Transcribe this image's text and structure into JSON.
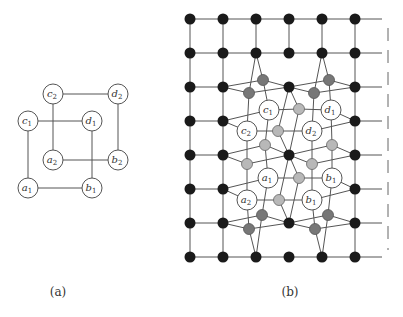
{
  "figure": {
    "panel_a": {
      "caption": "(a)",
      "nodes": [
        {
          "id": "c2",
          "letter": "c",
          "sub": "2",
          "x": 53,
          "y": 94
        },
        {
          "id": "d2",
          "letter": "d",
          "sub": "2",
          "x": 118,
          "y": 94
        },
        {
          "id": "c1",
          "letter": "c",
          "sub": "1",
          "x": 28,
          "y": 121
        },
        {
          "id": "d1",
          "letter": "d",
          "sub": "1",
          "x": 92,
          "y": 121
        },
        {
          "id": "a2",
          "letter": "a",
          "sub": "2",
          "x": 53,
          "y": 160
        },
        {
          "id": "b2",
          "letter": "b",
          "sub": "2",
          "x": 118,
          "y": 160
        },
        {
          "id": "a1",
          "letter": "a",
          "sub": "1",
          "x": 28,
          "y": 188
        },
        {
          "id": "b1",
          "letter": "b",
          "sub": "1",
          "x": 92,
          "y": 188
        }
      ],
      "edges": [
        [
          "c2",
          "d2"
        ],
        [
          "c2",
          "a2"
        ],
        [
          "d2",
          "b2"
        ],
        [
          "a2",
          "b2"
        ],
        [
          "c1",
          "d1"
        ],
        [
          "c1",
          "a1"
        ],
        [
          "d1",
          "b1"
        ],
        [
          "a1",
          "b1"
        ]
      ],
      "radius": 10
    },
    "panel_b": {
      "caption": "(b)",
      "grid": {
        "cols": [
          190,
          223,
          256,
          289,
          322,
          355
        ],
        "rows": [
          19,
          53,
          87,
          121,
          155,
          189,
          223,
          257
        ],
        "line_end_x": 382,
        "dash_x": 388,
        "black_color": "#1a1a1a"
      },
      "hidden_grid": [
        [
          2,
          3
        ],
        [
          3,
          3
        ],
        [
          2,
          4
        ],
        [
          3,
          4
        ],
        [
          2,
          5
        ],
        [
          3,
          5
        ],
        [
          4,
          3
        ],
        [
          4,
          4
        ],
        [
          4,
          5
        ],
        [
          1,
          3
        ],
        [
          1,
          4
        ],
        [
          1,
          5
        ]
      ],
      "dark_gray": {
        "color": "#777777",
        "nodes": [
          [
            263,
            80
          ],
          [
            249,
            93
          ],
          [
            329,
            80
          ],
          [
            314,
            93
          ],
          [
            262,
            215
          ],
          [
            249,
            229
          ],
          [
            328,
            215
          ],
          [
            315,
            229
          ]
        ]
      },
      "light_gray": {
        "color": "#b8b8b8",
        "nodes": [
          [
            299,
            109
          ],
          [
            278,
            131
          ],
          [
            265,
            145
          ],
          [
            332,
            145
          ],
          [
            247,
            164
          ],
          [
            312,
            164
          ],
          [
            299,
            178
          ],
          [
            279,
            200
          ]
        ]
      },
      "labeled": [
        {
          "letter": "c",
          "sub": "1",
          "x": 269,
          "y": 110
        },
        {
          "letter": "d",
          "sub": "1",
          "x": 331,
          "y": 110
        },
        {
          "letter": "c",
          "sub": "2",
          "x": 247,
          "y": 131
        },
        {
          "letter": "d",
          "sub": "2",
          "x": 312,
          "y": 131
        },
        {
          "letter": "a",
          "sub": "1",
          "x": 268,
          "y": 178
        },
        {
          "letter": "b",
          "sub": "1",
          "x": 332,
          "y": 178
        },
        {
          "letter": "a",
          "sub": "2",
          "x": 247,
          "y": 200
        },
        {
          "letter": "b",
          "sub": "1",
          "x": 312,
          "y": 200
        }
      ],
      "extra_edges": [
        [
          256,
          53,
          263,
          80
        ],
        [
          256,
          53,
          249,
          93
        ],
        [
          322,
          53,
          329,
          80
        ],
        [
          322,
          53,
          314,
          93
        ],
        [
          223,
          87,
          263,
          80
        ],
        [
          223,
          87,
          249,
          93
        ],
        [
          263,
          80,
          289,
          87
        ],
        [
          249,
          93,
          289,
          87
        ],
        [
          289,
          87,
          329,
          80
        ],
        [
          289,
          87,
          314,
          93
        ],
        [
          329,
          80,
          355,
          87
        ],
        [
          314,
          93,
          355,
          87
        ],
        [
          249,
          93,
          247,
          131
        ],
        [
          263,
          80,
          269,
          110
        ],
        [
          329,
          80,
          331,
          110
        ],
        [
          314,
          93,
          312,
          131
        ],
        [
          289,
          87,
          299,
          109
        ],
        [
          289,
          87,
          278,
          131
        ],
        [
          299,
          109,
          289,
          155
        ],
        [
          278,
          131,
          289,
          155
        ],
        [
          269,
          110,
          299,
          109
        ],
        [
          299,
          109,
          331,
          110
        ],
        [
          247,
          131,
          278,
          131
        ],
        [
          278,
          131,
          312,
          131
        ],
        [
          223,
          121,
          269,
          110
        ],
        [
          223,
          121,
          247,
          131
        ],
        [
          331,
          110,
          355,
          121
        ],
        [
          312,
          131,
          355,
          121
        ],
        [
          269,
          110,
          265,
          145
        ],
        [
          247,
          131,
          247,
          164
        ],
        [
          331,
          110,
          332,
          145
        ],
        [
          312,
          131,
          312,
          164
        ],
        [
          223,
          155,
          265,
          145
        ],
        [
          223,
          155,
          247,
          164
        ],
        [
          265,
          145,
          289,
          155
        ],
        [
          247,
          164,
          289,
          155
        ],
        [
          289,
          155,
          332,
          145
        ],
        [
          289,
          155,
          312,
          164
        ],
        [
          332,
          145,
          355,
          155
        ],
        [
          312,
          164,
          355,
          155
        ],
        [
          265,
          145,
          268,
          178
        ],
        [
          247,
          164,
          247,
          200
        ],
        [
          332,
          145,
          332,
          178
        ],
        [
          312,
          164,
          312,
          200
        ],
        [
          268,
          178,
          299,
          178
        ],
        [
          299,
          178,
          332,
          178
        ],
        [
          247,
          200,
          279,
          200
        ],
        [
          279,
          200,
          312,
          200
        ],
        [
          223,
          189,
          268,
          178
        ],
        [
          223,
          189,
          247,
          200
        ],
        [
          332,
          178,
          355,
          189
        ],
        [
          312,
          200,
          355,
          189
        ],
        [
          289,
          155,
          299,
          178
        ],
        [
          289,
          155,
          279,
          200
        ],
        [
          299,
          178,
          289,
          223
        ],
        [
          279,
          200,
          289,
          223
        ],
        [
          268,
          178,
          262,
          215
        ],
        [
          247,
          200,
          249,
          229
        ],
        [
          332,
          178,
          328,
          215
        ],
        [
          312,
          200,
          315,
          229
        ],
        [
          223,
          223,
          262,
          215
        ],
        [
          223,
          223,
          249,
          229
        ],
        [
          262,
          215,
          289,
          223
        ],
        [
          249,
          229,
          289,
          223
        ],
        [
          289,
          223,
          328,
          215
        ],
        [
          289,
          223,
          315,
          229
        ],
        [
          328,
          215,
          355,
          223
        ],
        [
          315,
          229,
          355,
          223
        ],
        [
          262,
          215,
          256,
          257
        ],
        [
          249,
          229,
          256,
          257
        ],
        [
          328,
          215,
          322,
          257
        ],
        [
          315,
          229,
          322,
          257
        ]
      ],
      "radius": 10
    }
  }
}
